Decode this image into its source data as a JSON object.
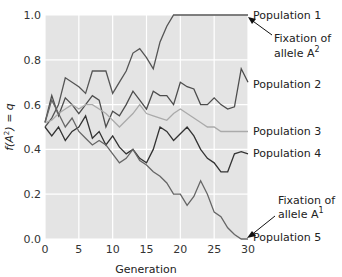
{
  "chart_data": {
    "type": "line",
    "title": "",
    "xlabel": "Generation",
    "ylabel": "f(A²) = q",
    "xlim": [
      0,
      30
    ],
    "ylim": [
      0.0,
      1.0
    ],
    "x_ticks": [
      "0",
      "5",
      "10",
      "15",
      "20",
      "25",
      "30"
    ],
    "y_ticks": [
      "0.0",
      "0.2",
      "0.4",
      "0.6",
      "0.8",
      "1.0"
    ],
    "grid": true,
    "background": "#e4e4e4",
    "x": [
      0,
      1,
      2,
      3,
      4,
      5,
      6,
      7,
      8,
      9,
      10,
      11,
      12,
      13,
      14,
      15,
      16,
      17,
      18,
      19,
      20,
      21,
      22,
      23,
      24,
      25,
      26,
      27,
      28,
      29,
      30
    ],
    "series": [
      {
        "name": "Population 1",
        "color": "#555555",
        "values": [
          0.5,
          0.54,
          0.6,
          0.72,
          0.7,
          0.68,
          0.65,
          0.75,
          0.75,
          0.75,
          0.65,
          0.7,
          0.75,
          0.83,
          0.85,
          0.81,
          0.76,
          0.88,
          0.95,
          1.0,
          1.0,
          1.0,
          1.0,
          1.0,
          1.0,
          1.0,
          1.0,
          1.0,
          1.0,
          1.0,
          1.0
        ]
      },
      {
        "name": "Population 2",
        "color": "#4d4d4d",
        "values": [
          0.52,
          0.64,
          0.55,
          0.63,
          0.6,
          0.56,
          0.6,
          0.64,
          0.62,
          0.5,
          0.57,
          0.55,
          0.6,
          0.66,
          0.62,
          0.58,
          0.66,
          0.64,
          0.64,
          0.6,
          0.7,
          0.68,
          0.67,
          0.6,
          0.6,
          0.63,
          0.6,
          0.58,
          0.59,
          0.76,
          0.7
        ]
      },
      {
        "name": "Population 3",
        "color": "#aaaaaa",
        "values": [
          0.52,
          0.53,
          0.56,
          0.58,
          0.6,
          0.58,
          0.6,
          0.6,
          0.58,
          0.56,
          0.53,
          0.5,
          0.53,
          0.56,
          0.6,
          0.56,
          0.55,
          0.54,
          0.53,
          0.56,
          0.58,
          0.56,
          0.54,
          0.52,
          0.5,
          0.5,
          0.48,
          0.48,
          0.48,
          0.48,
          0.48
        ]
      },
      {
        "name": "Population 4",
        "color": "#333333",
        "values": [
          0.5,
          0.46,
          0.5,
          0.44,
          0.48,
          0.5,
          0.55,
          0.45,
          0.48,
          0.42,
          0.46,
          0.41,
          0.38,
          0.4,
          0.36,
          0.34,
          0.4,
          0.5,
          0.48,
          0.44,
          0.47,
          0.5,
          0.46,
          0.4,
          0.36,
          0.34,
          0.3,
          0.3,
          0.38,
          0.39,
          0.38
        ]
      },
      {
        "name": "Population 5",
        "color": "#666666",
        "values": [
          0.52,
          0.62,
          0.56,
          0.5,
          0.54,
          0.48,
          0.45,
          0.42,
          0.44,
          0.42,
          0.38,
          0.34,
          0.36,
          0.4,
          0.35,
          0.33,
          0.3,
          0.28,
          0.25,
          0.2,
          0.2,
          0.15,
          0.19,
          0.26,
          0.2,
          0.12,
          0.1,
          0.05,
          0.02,
          0.0,
          0.0
        ]
      }
    ],
    "annotations": [
      {
        "text": "Fixation of allele A²",
        "target": "Population 1 at generation 30, value 1.0"
      },
      {
        "text": "Fixation of allele A¹",
        "target": "Population 5 at generation 29, value 0.0"
      }
    ],
    "legend_position": "right (direct line labels)"
  },
  "labels": {
    "pop1": "Population 1",
    "pop2": "Population 2",
    "pop3": "Population 3",
    "pop4": "Population 4",
    "pop5": "Population 5",
    "fix_a2_line1": "Fixation of",
    "fix_a2_line2": "allele A",
    "fix_a2_sup": "2",
    "fix_a1_line1": "Fixation of",
    "fix_a1_line2": "allele A",
    "fix_a1_sup": "1",
    "xlabel": "Generation",
    "ylabel_f": "f",
    "ylabel_rest": "(A",
    "ylabel_sup": "2",
    "ylabel_end": ") = q"
  }
}
